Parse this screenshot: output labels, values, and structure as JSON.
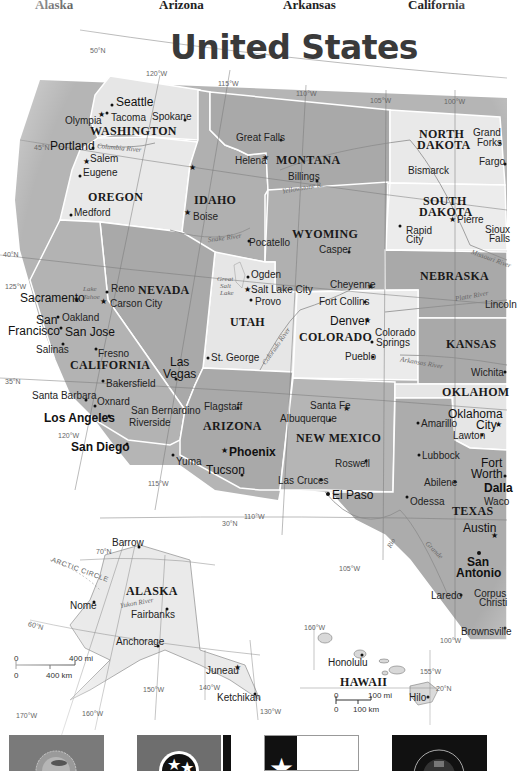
{
  "top_labels": [
    {
      "label": "Alaska",
      "x": 35
    },
    {
      "label": "Arizona",
      "x": 159
    },
    {
      "label": "Arkansas",
      "x": 283
    },
    {
      "label": "California",
      "x": 408
    }
  ],
  "map": {
    "title": "United States",
    "colors": {
      "light_state": "#e9e9e9",
      "dark_state": "#a9a9a9",
      "mid_state": "#bdbdbd",
      "border": "#ffffff",
      "background": "#ffffff"
    },
    "graticule": {
      "lat_50": "50°N",
      "lat_45": "45°N",
      "lat_40": "40°N",
      "lat_35": "35°N",
      "lat_30": "30°N",
      "lon_125": "125°W",
      "lon_120": "120°W",
      "lon_120b": "120°W",
      "lon_115": "115°W",
      "lon_115b": "115°W",
      "lon_110": "110°W",
      "lon_110b": "110°W",
      "lon_105": "105°W",
      "lon_105b": "105°W",
      "lon_100": "100°W",
      "lon_100b": "100°W"
    },
    "states": {
      "washington": "WASHINGTON",
      "oregon": "OREGON",
      "idaho": "IDAHO",
      "montana": "MONTANA",
      "north_dakota_1": "NORTH",
      "north_dakota_2": "DAKOTA",
      "south_dakota_1": "SOUTH",
      "south_dakota_2": "DAKOTA",
      "wyoming": "WYOMING",
      "nebraska": "NEBRASKA",
      "nevada": "NEVADA",
      "utah": "UTAH",
      "colorado": "COLORADO",
      "kansas": "KANSAS",
      "california": "CALIFORNIA",
      "arizona": "ARIZONA",
      "new_mexico": "NEW MEXICO",
      "oklahoma": "OKLAHOM",
      "texas": "TEXAS",
      "alaska": "ALASKA",
      "hawaii": "HAWAII"
    },
    "cities": {
      "seattle": "Seattle",
      "olympia": "Olympia",
      "tacoma": "Tacoma",
      "spokane": "Spokane",
      "portland": "Portland",
      "salem": "Salem",
      "eugene": "Eugene",
      "medford": "Medford",
      "boise": "Boise",
      "pocatello": "Pocatello",
      "great_falls": "Great Falls",
      "helena": "Helena",
      "billings": "Billings",
      "grand_forks_1": "Grand",
      "grand_forks_2": "Forks",
      "fargo": "Fargo",
      "bismarck": "Bismarck",
      "pierre": "Pierre",
      "rapid_city_1": "Rapid",
      "rapid_city_2": "City",
      "sioux_falls_1": "Sioux",
      "sioux_falls_2": "Falls",
      "casper": "Casper",
      "cheyenne": "Cheyenne",
      "lincoln": "Lincoln",
      "ogden": "Ogden",
      "salt_lake_city": "Salt Lake City",
      "provo": "Provo",
      "st_george": "St. George",
      "fort_collins": "Fort Collins",
      "denver": "Denver",
      "colorado_springs_1": "Colorado",
      "colorado_springs_2": "Springs",
      "pueblo": "Pueblo",
      "wichita": "Wichita",
      "reno": "Reno",
      "carson_city": "Carson City",
      "sacramento": "Sacramento",
      "san_francisco_1": "San",
      "san_francisco_2": "Francisco",
      "oakland": "Oakland",
      "san_jose": "San Jose",
      "salinas": "Salinas",
      "fresno": "Fresno",
      "bakersfield": "Bakersfield",
      "las_vegas_1": "Las",
      "las_vegas_2": "Vegas",
      "santa_barbara": "Santa Barbara",
      "oxnard": "Oxnard",
      "san_bernardino": "San Bernardino",
      "los_angeles": "Los Angeles",
      "riverside": "Riverside",
      "san_diego": "San Diego",
      "yuma": "Yuma",
      "flagstaff": "Flagstaff",
      "phoenix": "Phoenix",
      "tucson": "Tucson",
      "santa_fe": "Santa Fe",
      "albuquerque": "Albuquerque",
      "roswell": "Roswell",
      "las_cruces": "Las Cruces",
      "el_paso": "El Paso",
      "amarillo": "Amarillo",
      "oklahoma_city_1": "Oklahoma",
      "oklahoma_city_2": "City",
      "lawton": "Lawton",
      "lubbock": "Lubbock",
      "fort_worth_1": "Fort",
      "fort_worth_2": "Worth",
      "dallas": "Dalla",
      "abilene": "Abilene",
      "waco": "Waco",
      "odessa": "Odessa",
      "austin": "Austin",
      "san_antonio_1": "San",
      "san_antonio_2": "Antonio",
      "laredo": "Laredo",
      "corpus_christi_1": "Corpus",
      "corpus_christi_2": "Christi",
      "brownsville": "Brownsville",
      "barrow": "Barrow",
      "nome": "Nome",
      "fairbanks": "Fairbanks",
      "anchorage": "Anchorage",
      "juneau": "Juneau",
      "ketchikan": "Ketchikan",
      "honolulu": "Honolulu",
      "hilo": "Hilo"
    },
    "rivers": {
      "columbia": "Columbia River",
      "snake": "Snake River",
      "yellowstone": "Yellowstone R.",
      "missouri": "Missouri River",
      "platte": "Platte River",
      "colorado": "Colorado River",
      "arkansas": "Arkansas River",
      "rio_grande_1": "Rio",
      "rio_grande_2": "Grande",
      "yukon": "Yukon River",
      "lake_tahoe_1": "Lake",
      "lake_tahoe_2": "Tahoe",
      "gsl_1": "Great",
      "gsl_2": "Salt",
      "gsl_3": "Lake"
    },
    "alaska_inset": {
      "arctic_circle": "ARCTIC CIRCLE",
      "lat_70": "70°N",
      "lat_60": "60°N",
      "lon_170": "170°W",
      "lon_160": "160°W",
      "lon_150": "150°W",
      "lon_140": "140°W",
      "lon_130": "130°W",
      "scale_mi_0": "0",
      "scale_mi": "400 mi",
      "scale_km_0": "0",
      "scale_km": "400 km"
    },
    "hawaii_inset": {
      "lon_160": "160°W",
      "lon_155": "155°W",
      "lat_20": "20°N",
      "scale_mi_0": "0",
      "scale_mi": "100 mi",
      "scale_km_0": "0",
      "scale_km": "100 km"
    }
  },
  "flags": [
    {
      "name": "South Dakota flag"
    },
    {
      "name": "Tennessee flag"
    },
    {
      "name": "Texas flag"
    },
    {
      "name": "Wisconsin flag"
    }
  ]
}
